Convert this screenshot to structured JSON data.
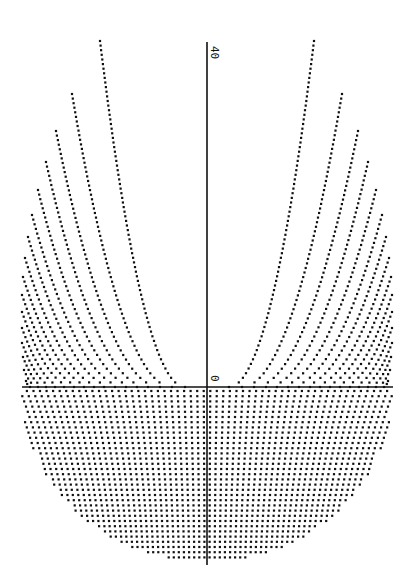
{
  "chart_data": {
    "type": "scatter",
    "title": "",
    "xlabel": "",
    "ylabel": "",
    "axes": {
      "origin_px": [
        207,
        387
      ],
      "x_axis_px": {
        "x_start": 22,
        "x_end": 393,
        "y": 387
      },
      "y_axis_px": {
        "x": 207,
        "y_start": 42,
        "y_end": 565
      },
      "tick_labels": [
        {
          "text": "40",
          "position": "top of vertical axis",
          "rotated_deg": 90
        },
        {
          "text": "0",
          "position": "near origin",
          "rotated_deg": 90
        }
      ],
      "ylim": [
        0,
        40
      ],
      "grid": false
    },
    "upper_curves": {
      "count_per_side": 16,
      "left_start_points_px": [
        [
          100,
          41
        ],
        [
          72,
          94
        ],
        [
          56,
          131
        ],
        [
          46,
          162
        ],
        [
          38,
          190
        ],
        [
          32,
          215
        ],
        [
          28,
          237
        ],
        [
          25,
          258
        ],
        [
          23,
          277
        ],
        [
          22,
          295
        ],
        [
          22,
          312
        ],
        [
          22,
          328
        ],
        [
          22,
          343
        ],
        [
          23,
          357
        ],
        [
          24,
          370
        ],
        [
          26,
          381
        ]
      ],
      "left_axis_crossings_px": [
        185,
        172,
        160,
        148,
        137,
        126,
        115,
        104,
        94,
        84,
        74,
        64,
        55,
        46,
        38,
        30
      ],
      "mirror_symmetric": true
    },
    "lower_region": {
      "envelope": "semi-ellipse",
      "center_px": [
        207,
        387
      ],
      "rx_px": 186,
      "ry_px": 175,
      "column_spacing_px": 6.6,
      "dot_spacing_px": 5.2
    },
    "dot_color": "#111111",
    "axis_color": "#111111"
  },
  "labels": {
    "top_tick": "40",
    "origin_tick": "0"
  }
}
